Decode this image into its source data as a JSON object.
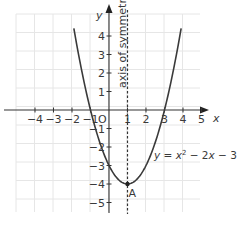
{
  "chart_data": {
    "type": "line",
    "title": "",
    "xlabel": "x",
    "ylabel": "y",
    "xlim": [
      -5,
      5
    ],
    "ylim": [
      -5,
      5
    ],
    "grid": true,
    "x_ticks": [
      -4,
      -3,
      -2,
      -1,
      1,
      2,
      3,
      4,
      5
    ],
    "x_tick_labels": [
      "−4",
      "−3",
      "−2",
      "−1",
      "1",
      "2",
      "3",
      "4",
      "5"
    ],
    "y_ticks": [
      4,
      3,
      2,
      1,
      -1,
      -2,
      -3,
      -4,
      -5
    ],
    "y_tick_labels": [
      "4",
      "3",
      "2",
      "1",
      "−1",
      "−2",
      "−3",
      "−4",
      "−5"
    ],
    "origin_label": "O",
    "series": [
      {
        "name": "y = x² − 2x − 3",
        "equation": "y = x^2 - 2x - 3",
        "x": [
          -1.9,
          -1.5,
          -1,
          -0.5,
          0,
          0.5,
          1,
          1.5,
          2,
          2.5,
          3,
          3.5,
          3.9
        ],
        "y": [
          4.41,
          2.25,
          0,
          -1.75,
          -3,
          -3.75,
          -4,
          -3.75,
          -3,
          -1.75,
          0,
          2.25,
          4.41
        ]
      }
    ],
    "annotations": [
      {
        "type": "vertical-dashed-line",
        "x": 1,
        "label": "axis of symmetry"
      },
      {
        "type": "point",
        "x": 1,
        "y": -4,
        "label": "A"
      },
      {
        "type": "curve-label",
        "text": "y = x² − 2x − 3",
        "x": 1.6,
        "y": -2.3
      }
    ]
  },
  "labels": {
    "x_axis": "x",
    "y_axis": "y",
    "origin": "O",
    "symmetry": "axis of symmetry",
    "vertex": "A",
    "equation_y": "y",
    "equation_eq": " = ",
    "equation_x": "x",
    "equation_sup": "2",
    "equation_rest1": " − 2",
    "equation_x2": "x",
    "equation_rest2": " − 3"
  }
}
